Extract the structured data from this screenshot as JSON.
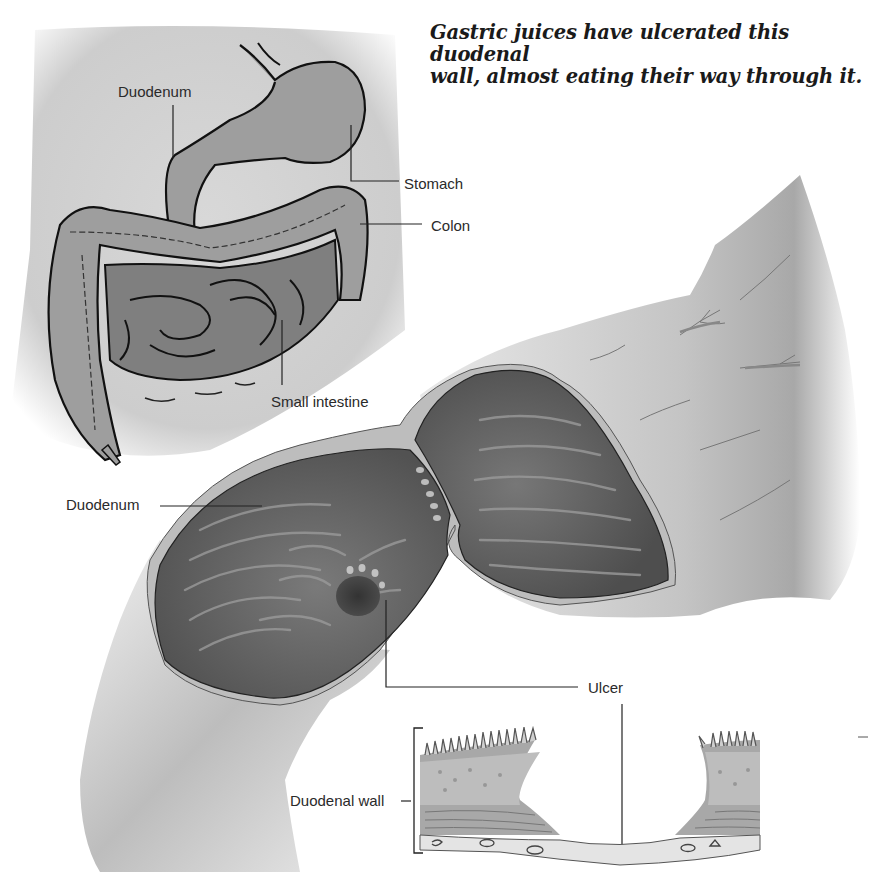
{
  "caption": {
    "line1": "Gastric juices have ulcerated this duodenal",
    "line2": "wall, almost eating their way through it."
  },
  "overview_labels": {
    "duodenum": "Duodenum",
    "stomach": "Stomach",
    "colon": "Colon",
    "small_intestine": "Small intestine"
  },
  "detail_labels": {
    "duodenum": "Duodenum",
    "ulcer": "Ulcer",
    "duodenal_wall": "Duodenal wall"
  },
  "colors": {
    "background": "#ffffff",
    "torso_shade": "#c9c9c9",
    "organ_fill": "#9d9d9d",
    "organ_outline": "#111111",
    "lumen_dark": "#5a5a5a",
    "ulcer_crater": "#2e2e2e",
    "label_text": "#2a2a2a"
  }
}
